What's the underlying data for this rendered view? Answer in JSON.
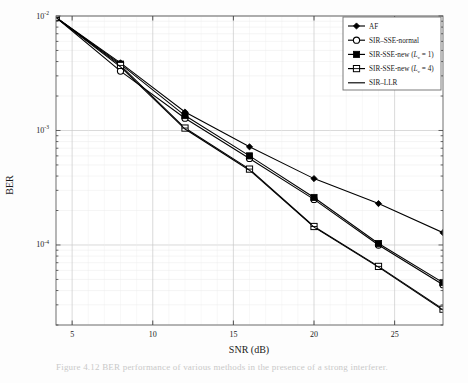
{
  "figure": {
    "caption": "Figure 4.12   BER performance of various methods in the presence of a strong interferer."
  },
  "chart_data": {
    "type": "line",
    "title": "",
    "xlabel": "SNR (dB)",
    "ylabel": "BER",
    "xlim": [
      4,
      28
    ],
    "ylim": [
      2e-05,
      0.01
    ],
    "yscale": "log",
    "xticks": [
      5,
      10,
      15,
      20,
      25
    ],
    "xtick_labels": [
      "5",
      "10",
      "15",
      "20",
      "25"
    ],
    "yticks": [
      0.01,
      0.001,
      0.0001
    ],
    "ytick_labels": [
      "10-2",
      "10-3",
      "10-4"
    ],
    "ytick_base": "10",
    "ytick_exponents": [
      "-2",
      "-3",
      "-4"
    ],
    "grid": true,
    "minor_grid": true,
    "legend_position": "top-right",
    "x": [
      4,
      8,
      12,
      16,
      20,
      24,
      28
    ],
    "series": [
      {
        "name": "AF",
        "marker": "filled-diamond",
        "values": [
          0.0097,
          0.0039,
          0.00145,
          0.00072,
          0.00038,
          0.00023,
          0.000128
        ]
      },
      {
        "name": "SIR-SSE-normal",
        "marker": "open-circle",
        "values": [
          0.0097,
          0.0033,
          0.00128,
          0.00057,
          0.00025,
          0.0001,
          4.5e-05
        ]
      },
      {
        "name": "SIR-SSE-new (Lv = 1)",
        "marker": "filled-square-cross",
        "label_prefix": "SIR-SSE-new (",
        "label_var": "L",
        "label_sub": "v",
        "label_suffix": " = 1)",
        "values": [
          0.0097,
          0.0038,
          0.00135,
          0.0006,
          0.00026,
          0.000103,
          4.7e-05
        ]
      },
      {
        "name": "SIR-SSE-new (Lv = 4)",
        "marker": "open-square-cross",
        "label_prefix": "SIR-SSE-new (",
        "label_var": "L",
        "label_sub": "v",
        "label_suffix": " = 4)",
        "values": [
          0.0097,
          0.0037,
          0.00105,
          0.00046,
          0.000145,
          6.5e-05,
          2.75e-05
        ]
      },
      {
        "name": "SIR-LLR",
        "marker": "none",
        "values": [
          0.0097,
          0.0036,
          0.00103,
          0.00045,
          0.000143,
          6.4e-05,
          2.7e-05
        ]
      }
    ]
  },
  "legend": {
    "entries": [
      {
        "label": "AF"
      },
      {
        "label": "SIR–SSE-normal"
      },
      {
        "label": "SIR–SSE-new (L_v = 1)"
      },
      {
        "label": "SIR–SSE-new (L_v = 4)"
      },
      {
        "label": "SIR–LLR"
      }
    ]
  }
}
